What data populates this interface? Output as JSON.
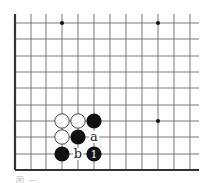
{
  "diagram": {
    "type": "go-board-fragment",
    "grid": {
      "columns_x": [
        15,
        31,
        46,
        62,
        78,
        94,
        110,
        126,
        142,
        158,
        174,
        190
      ],
      "rows_y": [
        23,
        39,
        56,
        72,
        88,
        105,
        121,
        137,
        154,
        170
      ],
      "right_extent": 199,
      "top_extent": 14,
      "left_edge_thick": true,
      "bottom_edge_thick": true,
      "line_color": "#555555",
      "edge_color": "#333333"
    },
    "star_points": [
      {
        "col": 3,
        "row": 0
      },
      {
        "col": 9,
        "row": 0
      },
      {
        "col": 9,
        "row": 6
      }
    ],
    "stones": [
      {
        "color": "white",
        "col": 3,
        "row": 6
      },
      {
        "color": "white",
        "col": 4,
        "row": 6
      },
      {
        "color": "black",
        "col": 5,
        "row": 6
      },
      {
        "color": "white",
        "col": 3,
        "row": 7
      },
      {
        "color": "black",
        "col": 4,
        "row": 7
      },
      {
        "color": "black",
        "col": 3,
        "row": 8
      },
      {
        "color": "black",
        "col": 5,
        "row": 8,
        "label": "1"
      }
    ],
    "markers": [
      {
        "col": 5,
        "row": 7,
        "label": "a"
      },
      {
        "col": 4,
        "row": 8,
        "label": "b"
      }
    ],
    "stone_radius": 7.6,
    "colors": {
      "black_stone": "#111111",
      "white_stone": "#ffffff",
      "white_stone_border": "#333333",
      "label_on_black": "#ffffff",
      "marker_text": "#222222"
    }
  },
  "caption": {
    "text": "图 —"
  }
}
